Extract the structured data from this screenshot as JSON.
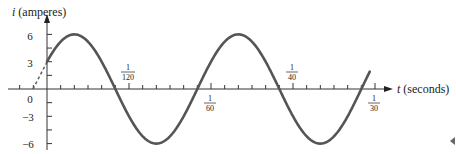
{
  "chart_data": {
    "type": "line",
    "title": "",
    "xlabel": "t (seconds)",
    "ylabel": "i (amperes)",
    "function": "i = 6 sin(120πt + π/6)",
    "xlim": [
      -0.0017,
      0.0335
    ],
    "ylim": [
      -6,
      6
    ],
    "x_ticks": [
      {
        "value": 0.008333,
        "label_num": "1",
        "label_den": "120",
        "position": "above"
      },
      {
        "value": 0.016667,
        "label_num": "1",
        "label_den": "60",
        "position": "below"
      },
      {
        "value": 0.025,
        "label_num": "1",
        "label_den": "40",
        "position": "above"
      },
      {
        "value": 0.033333,
        "label_num": "1",
        "label_den": "30",
        "position": "below"
      }
    ],
    "x_minor_tick_step": 0.0013889,
    "y_ticks": [
      6,
      3,
      0,
      -3,
      -6
    ],
    "y_minor_tick_step": 1.5,
    "series": [
      {
        "name": "current",
        "amplitude": 6,
        "angular_frequency": "120π",
        "phase": "π/6",
        "t_start": 0,
        "t_end": 0.0328,
        "style": "solid",
        "color": "#555555"
      },
      {
        "name": "phase-extension",
        "t_start": -0.001389,
        "t_end": 0,
        "style": "dashed",
        "color": "#555555"
      }
    ],
    "grid": false,
    "legend": null
  },
  "labels": {
    "y_axis": "(amperes)",
    "y_axis_var": "i",
    "x_axis": "(seconds)",
    "x_axis_var": "t",
    "y6": "6",
    "y3": "3",
    "y0": "0",
    "ym3": "−3",
    "ym6": "−6",
    "t1_num": "1",
    "t1_den": "120",
    "t2_num": "1",
    "t2_den": "60",
    "t3_num": "1",
    "t3_den": "40",
    "t4_num": "1",
    "t4_den": "30"
  },
  "colors": {
    "curve": "#555555",
    "axis": "#333333",
    "text": "#222222"
  }
}
